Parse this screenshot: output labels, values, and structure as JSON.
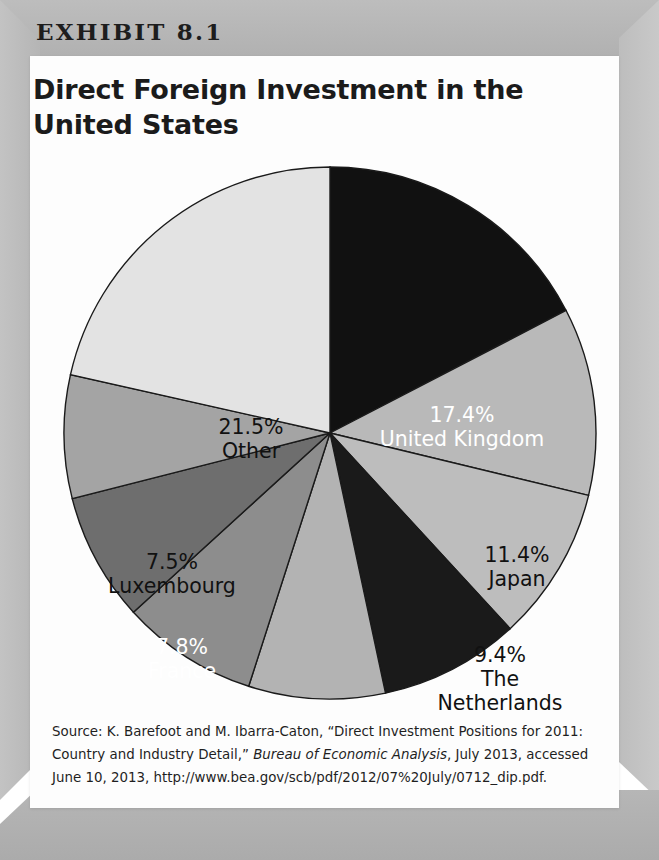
{
  "exhibit": {
    "label": "EXHIBIT 8.1",
    "title": "Direct Foreign Investment in the United States"
  },
  "source": {
    "prefix": "Source: K. Barefoot and M. Ibarra-Caton, “Direct Investment Positions for 2011: Country and Industry Detail,” ",
    "italic": "Bureau of Economic Analysis",
    "suffix": ", July 2013, accessed June 10, 2013, http://www.bea.gov/scb/pdf/2012/07%20July/0712_dip.pdf."
  },
  "chart_data": {
    "type": "pie",
    "title": "Direct Foreign Investment in the United States",
    "unit": "percent",
    "start_angle_deg": 0,
    "direction": "clockwise",
    "legend": "none (labels drawn inside slices)",
    "categories": [
      "United Kingdom",
      "Japan",
      "The Netherlands",
      "Germany",
      "Switzerland",
      "Canada",
      "France",
      "Luxembourg",
      "Other"
    ],
    "values": [
      17.4,
      11.4,
      9.4,
      8.5,
      8.3,
      8.3,
      7.8,
      7.5,
      21.5
    ],
    "value_labels": [
      "17.4%",
      "11.4%",
      "9.4%",
      "8.5%",
      "8.3%",
      "8.3%",
      "7.8%",
      "7.5%",
      "21.5%"
    ],
    "slice_colors": [
      "#111111",
      "#b9b9b9",
      "#bdbdbd",
      "#1a1a1a",
      "#b3b3b3",
      "#8d8d8d",
      "#6e6e6e",
      "#a4a4a4",
      "#e3e3e3"
    ],
    "label_text_colors": [
      "#ffffff",
      "#111111",
      "#111111",
      "#ffffff",
      "#111111",
      "#ffffff",
      "#ffffff",
      "#111111",
      "#111111"
    ],
    "slices": [
      {
        "name": "United Kingdom",
        "value": 17.4,
        "value_label": "17.4%",
        "color": "#111111",
        "text_color": "#ffffff",
        "lines": [
          "17.4%",
          "United Kingdom"
        ],
        "label_x": 432,
        "label_y": 278
      },
      {
        "name": "Japan",
        "value": 11.4,
        "value_label": "11.4%",
        "color": "#b9b9b9",
        "text_color": "#111111",
        "lines": [
          "11.4%",
          "Japan"
        ],
        "label_x": 487,
        "label_y": 418
      },
      {
        "name": "The Netherlands",
        "value": 9.4,
        "value_label": "9.4%",
        "color": "#bdbdbd",
        "text_color": "#111111",
        "lines": [
          "9.4%",
          "The",
          "Netherlands"
        ],
        "label_x": 470,
        "label_y": 530
      },
      {
        "name": "Germany",
        "value": 8.5,
        "value_label": "8.5%",
        "color": "#1a1a1a",
        "text_color": "#ffffff",
        "lines": [
          "8.5%",
          "Germany"
        ],
        "label_x": 374,
        "label_y": 612
      },
      {
        "name": "Switzerland",
        "value": 8.3,
        "value_label": "8.3%",
        "color": "#b3b3b3",
        "text_color": "#111111",
        "lines": [
          "8.3%",
          "Switzerland"
        ],
        "label_x": 264,
        "label_y": 644
      },
      {
        "name": "Canada",
        "value": 8.3,
        "value_label": "8.3%",
        "color": "#8d8d8d",
        "text_color": "#ffffff",
        "lines": [
          "8.3%",
          "Canada"
        ],
        "label_x": 186,
        "label_y": 597
      },
      {
        "name": "France",
        "value": 7.8,
        "value_label": "7.8%",
        "color": "#6e6e6e",
        "text_color": "#ffffff",
        "lines": [
          "7.8%",
          "France"
        ],
        "label_x": 152,
        "label_y": 510
      },
      {
        "name": "Luxembourg",
        "value": 7.5,
        "value_label": "7.5%",
        "color": "#a4a4a4",
        "text_color": "#111111",
        "lines": [
          "7.5%",
          "Luxembourg"
        ],
        "label_x": 142,
        "label_y": 425
      },
      {
        "name": "Other",
        "value": 21.5,
        "value_label": "21.5%",
        "color": "#e3e3e3",
        "text_color": "#111111",
        "lines": [
          "21.5%",
          "Other"
        ],
        "label_x": 221,
        "label_y": 290
      }
    ]
  },
  "colors": {
    "frame": "#b8b8b8",
    "card": "#fdfdfd",
    "text": "#1b1b1b"
  }
}
